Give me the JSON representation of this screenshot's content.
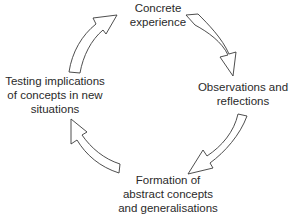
{
  "diagram": {
    "stages": [
      {
        "id": "top",
        "lines": [
          "Concrete",
          "experience"
        ]
      },
      {
        "id": "right",
        "lines": [
          "Observations and",
          "reflections"
        ]
      },
      {
        "id": "bottom",
        "lines": [
          "Formation of",
          "abstract concepts",
          "and generalisations"
        ]
      },
      {
        "id": "left",
        "lines": [
          "Testing implications",
          "of concepts in new",
          "situations"
        ]
      }
    ],
    "arrows": [
      {
        "from": "top",
        "to": "right",
        "icon": "curved-arrow-down-right"
      },
      {
        "from": "right",
        "to": "bottom",
        "icon": "curved-arrow-down-left"
      },
      {
        "from": "bottom",
        "to": "left",
        "icon": "curved-arrow-up-left"
      },
      {
        "from": "left",
        "to": "top",
        "icon": "curved-arrow-up-right"
      }
    ]
  }
}
